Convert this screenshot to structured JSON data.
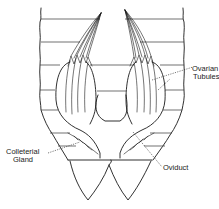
{
  "figure": {
    "type": "anatomical-line-drawing",
    "labels": {
      "ovarian_tubules_line1": "Ovarian",
      "ovarian_tubules_line2": "Tubules",
      "colleterial_gland_line1": "Colleterial",
      "colleterial_gland_line2": "Gland",
      "oviduct": "Oviduct"
    },
    "colors": {
      "line": "#1a1a1a",
      "background": "#ffffff"
    }
  }
}
